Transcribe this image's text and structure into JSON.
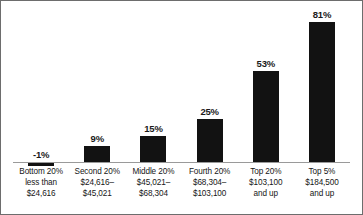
{
  "chart_data": {
    "type": "bar",
    "title": "",
    "subtitle": "",
    "xlabel": "",
    "ylabel": "",
    "grid": false,
    "legend": "none",
    "ylim": [
      -5,
      90
    ],
    "categories": [
      "Bottom 20% less than $24,616",
      "Second 20% $24,616–$45,021",
      "Middle 20% $45,021–$68,304",
      "Fourth 20% $68,304–$103,100",
      "Top 20% $103,100 and up",
      "Top 5% $184,500 and up"
    ],
    "tick_label_lines": [
      [
        "Bottom 20%",
        "less than",
        "$24,616"
      ],
      [
        "Second 20%",
        "$24,616–",
        "$45,021"
      ],
      [
        "Middle 20%",
        "$45,021–",
        "$68,304"
      ],
      [
        "Fourth 20%",
        "$68,304–",
        "$103,100"
      ],
      [
        "Top 20%",
        "$103,100",
        "and up"
      ],
      [
        "Top 5%",
        "$184,500",
        "and up"
      ]
    ],
    "values": [
      -1,
      9,
      15,
      25,
      53,
      81
    ],
    "value_labels": [
      "-1%",
      "9%",
      "15%",
      "25%",
      "53%",
      "81%"
    ],
    "bar_color": "#121212",
    "axis_color": "#9a9a9a",
    "border_color": "#6d6d6d",
    "text_color": "#161616"
  }
}
